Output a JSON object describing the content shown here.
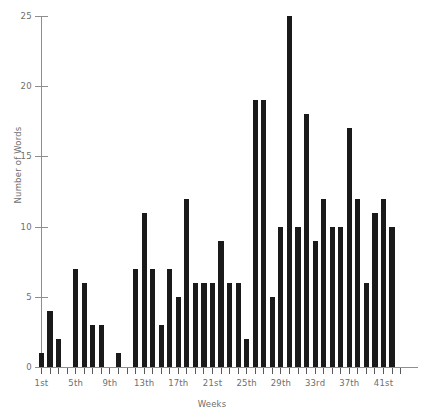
{
  "chart_data": {
    "type": "bar",
    "title": "",
    "xlabel": "Weeks",
    "ylabel": "Number of Words",
    "ylim": [
      0,
      25
    ],
    "grid": false,
    "legend": null,
    "bar_color": "#1a1a1a",
    "axis_color": "#8e8e8e",
    "label_color": "#6e6e6e",
    "y_ticks": [
      0,
      5,
      10,
      15,
      20,
      25
    ],
    "y_tick_labels": [
      "0",
      "5",
      "10",
      "15",
      "20",
      "25"
    ],
    "x_tick_labels": [
      "1st",
      "5th",
      "9th",
      "13th",
      "17th",
      "21st",
      "25th",
      "29th",
      "33rd",
      "37th",
      "41st"
    ],
    "x_tick_weeks": [
      1,
      5,
      9,
      13,
      17,
      21,
      25,
      29,
      33,
      37,
      41
    ],
    "categories": [
      "1st",
      "2nd",
      "3rd",
      "4th",
      "5th",
      "6th",
      "7th",
      "8th",
      "9th",
      "10th",
      "11th",
      "12th",
      "13th",
      "14th",
      "15th",
      "16th",
      "17th",
      "18th",
      "19th",
      "20th",
      "21st",
      "22nd",
      "23rd",
      "24th",
      "25th",
      "26th",
      "27th",
      "28th",
      "29th",
      "30th",
      "31st",
      "32nd",
      "33rd",
      "34th",
      "35th",
      "36th",
      "37th",
      "38th",
      "39th",
      "40th",
      "41st",
      "42nd",
      "43rd"
    ],
    "values": [
      1,
      4,
      2,
      0,
      7,
      6,
      3,
      3,
      0,
      1,
      0,
      7,
      11,
      7,
      3,
      7,
      5,
      12,
      6,
      6,
      6,
      9,
      6,
      6,
      2,
      19,
      19,
      5,
      10,
      25,
      10,
      18,
      9,
      12,
      10,
      10,
      17,
      12,
      6,
      11,
      12,
      10,
      0
    ]
  }
}
